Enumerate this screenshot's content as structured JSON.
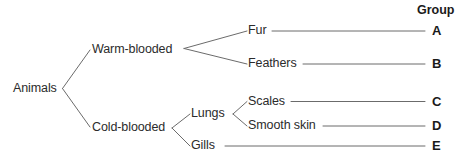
{
  "diagram": {
    "type": "classification-key-tree",
    "root": {
      "label": "Animals",
      "x": 13,
      "y": 82
    },
    "level1": [
      {
        "label": "Warm-blooded",
        "x": 92,
        "y": 43
      },
      {
        "label": "Cold-blooded",
        "x": 92,
        "y": 121
      }
    ],
    "level2": [
      {
        "label": "Lungs",
        "x": 191,
        "y": 107
      },
      {
        "label": "Gills",
        "x": 191,
        "y": 139
      }
    ],
    "leaves": [
      {
        "label": "Fur",
        "x": 248,
        "y": 24,
        "line_start": 272,
        "line_end": 425,
        "group": "A",
        "group_x": 432,
        "group_y": 24
      },
      {
        "label": "Feathers",
        "x": 248,
        "y": 57,
        "line_start": 303,
        "line_end": 425,
        "group": "B",
        "group_x": 432,
        "group_y": 57
      },
      {
        "label": "Scales",
        "x": 248,
        "y": 95,
        "line_start": 291,
        "line_end": 425,
        "group": "C",
        "group_x": 432,
        "group_y": 95
      },
      {
        "label": "Smooth skin",
        "x": 248,
        "y": 119,
        "line_start": 323,
        "line_end": 425,
        "group": "D",
        "group_x": 432,
        "group_y": 119
      },
      {
        "label": "Gills",
        "x": 191,
        "y": 139,
        "line_start": 225,
        "line_end": 425,
        "group": "E",
        "group_x": 432,
        "group_y": 139
      }
    ],
    "header": {
      "label": "Group",
      "x": 417,
      "y": 4
    },
    "colors": {
      "background": "#ffffff",
      "text": "#2b2b2b",
      "bold_text": "#1a1a1a",
      "line": "#6b6b6b"
    }
  },
  "labels": {
    "animals": "Animals",
    "warm_blooded": "Warm-blooded",
    "cold_blooded": "Cold-blooded",
    "lungs": "Lungs",
    "gills_node": "Gills",
    "fur": "Fur",
    "feathers": "Feathers",
    "scales": "Scales",
    "smooth_skin": "Smooth skin",
    "group_header": "Group",
    "group_a": "A",
    "group_b": "B",
    "group_c": "C",
    "group_d": "D",
    "group_e": "E"
  }
}
